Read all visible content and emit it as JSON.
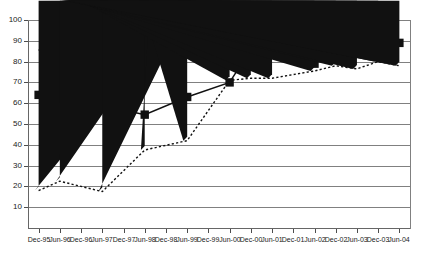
{
  "chart_data": {
    "type": "line",
    "title": "",
    "xlabel": "",
    "ylabel": "",
    "ylim": [
      0,
      100
    ],
    "ytick_step": 10,
    "yticks": [
      100,
      90,
      80,
      70,
      60,
      50,
      40,
      30,
      20,
      10
    ],
    "grid": true,
    "legend_position": "none",
    "categories": [
      "Dec-95",
      "Jun-96",
      "Dec-96",
      "Jun-97",
      "Dec-97",
      "Jun-98",
      "Dec-98",
      "Jun-99",
      "Dec-99",
      "Jun-00",
      "Dec-00",
      "Jun-01",
      "Dec-01",
      "Jun-02",
      "Dec-02",
      "Jun-03",
      "Dec-03",
      "Jun-04"
    ],
    "series": [
      {
        "name": "Series 1",
        "marker": "diamond",
        "linestyle": "dashed",
        "color": "#111111",
        "x": [
          "Dec-95",
          "Jun-96",
          "Dec-97",
          "Jun-99",
          "Dec-00",
          "Jun-01",
          "Dec-01",
          "Jun-02",
          "Dec-02",
          "Jun-03",
          "Dec-03",
          "Jun-04"
        ],
        "values": [
          85.5,
          88.5,
          89.5,
          91.5,
          93.5,
          89,
          93.5,
          91.5,
          91.5,
          91.5,
          90,
          93.5
        ]
      },
      {
        "name": "Series 2",
        "marker": "square",
        "linestyle": "solid",
        "color": "#111111",
        "x": [
          "Dec-95",
          "Jun-96",
          "Dec-97",
          "Jun-99",
          "Dec-00",
          "Jun-01",
          "Dec-01",
          "Jun-02",
          "Dec-02",
          "Jun-03",
          "Dec-03",
          "Jun-04"
        ],
        "values": [
          64,
          50,
          59,
          54.5,
          63,
          86,
          87,
          86,
          79,
          87,
          85,
          89
        ]
      },
      {
        "name": "Series 3",
        "marker": "triangle",
        "linestyle": "dotted",
        "color": "#111111",
        "x": [
          "Dec-95",
          "Jun-96",
          "Dec-97",
          "Jun-99",
          "Dec-00",
          "Jun-01",
          "Dec-01",
          "Jun-02",
          "Dec-02",
          "Jun-03",
          "Dec-03",
          "Jun-04"
        ],
        "values": [
          18,
          22.5,
          17.5,
          37.5,
          42,
          71,
          72,
          72,
          75.5,
          78,
          76.5,
          78
        ]
      }
    ],
    "raw_points": {
      "diamond": [
        {
          "i": 0,
          "v": 85.5
        },
        {
          "i": 1,
          "v": 88.5
        },
        {
          "i": 3,
          "v": 89.5
        },
        {
          "i": 5,
          "v": 90.5
        },
        {
          "i": 7,
          "v": 91.5
        },
        {
          "i": 9,
          "v": 93.5
        },
        {
          "i": 10,
          "v": 89.0
        },
        {
          "i": 11,
          "v": 93.5
        },
        {
          "i": 13,
          "v": 91.5
        },
        {
          "i": 14,
          "v": 91.5
        },
        {
          "i": 15,
          "v": 91.5
        },
        {
          "i": 16,
          "v": 90.0
        },
        {
          "i": 17,
          "v": 93.5
        }
      ],
      "square": [
        {
          "i": 0,
          "v": 64.0
        },
        {
          "i": 1,
          "v": 50.0
        },
        {
          "i": 3,
          "v": 59.0
        },
        {
          "i": 5,
          "v": 54.5
        },
        {
          "i": 7,
          "v": 63.0
        },
        {
          "i": 9,
          "v": 70.0
        },
        {
          "i": 10,
          "v": 86.0
        },
        {
          "i": 11,
          "v": 87.5
        },
        {
          "i": 13,
          "v": 79.0
        },
        {
          "i": 14,
          "v": 87.0
        },
        {
          "i": 15,
          "v": 85.0
        },
        {
          "i": 16,
          "v": 84.0
        },
        {
          "i": 17,
          "v": 89.0
        }
      ],
      "triangle": [
        {
          "i": 0,
          "v": 18.0
        },
        {
          "i": 1,
          "v": 22.5
        },
        {
          "i": 3,
          "v": 17.5
        },
        {
          "i": 5,
          "v": 37.5
        },
        {
          "i": 7,
          "v": 42.0
        },
        {
          "i": 9,
          "v": 71.0
        },
        {
          "i": 10,
          "v": 72.0
        },
        {
          "i": 11,
          "v": 72.0
        },
        {
          "i": 13,
          "v": 75.5
        },
        {
          "i": 14,
          "v": 78.0
        },
        {
          "i": 15,
          "v": 76.5
        },
        {
          "i": 16,
          "v": 80.0
        },
        {
          "i": 17,
          "v": 78.0
        }
      ]
    }
  },
  "colors": {
    "ink": "#111111",
    "grid": "#808080",
    "axis": "#666666",
    "background": "#ffffff",
    "tick_text": "#1a1a1a"
  }
}
